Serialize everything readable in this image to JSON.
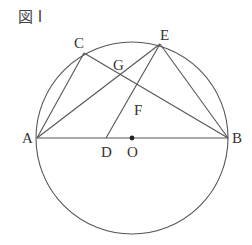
{
  "figure": {
    "title": "図 I"
  },
  "circle": {
    "cx": 132,
    "cy": 138,
    "r": 96
  },
  "points": {
    "A": {
      "label": "A",
      "x": 37,
      "y": 138
    },
    "B": {
      "label": "B",
      "x": 228,
      "y": 138
    },
    "C": {
      "label": "C",
      "x": 84,
      "y": 53
    },
    "E": {
      "label": "E",
      "x": 160,
      "y": 44
    },
    "G": {
      "label": "G",
      "x": 120,
      "y": 75
    },
    "F": {
      "label": "F",
      "x": 137,
      "y": 100
    },
    "D": {
      "label": "D",
      "x": 106,
      "y": 138
    },
    "O": {
      "label": "O",
      "x": 132,
      "y": 138
    }
  },
  "segments": [
    "AB",
    "AC",
    "AE",
    "CB",
    "EB",
    "ED"
  ],
  "colors": {
    "line": "#555555",
    "text": "#333333"
  }
}
